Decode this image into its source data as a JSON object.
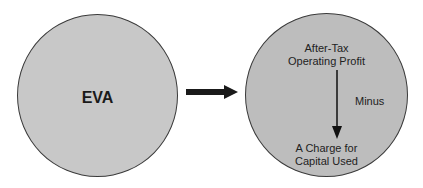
{
  "left_circle": {
    "label": "EVA"
  },
  "right_circle": {
    "top_line1": "After-Tax",
    "top_line2": "Operating Profit",
    "operator": "Minus",
    "bottom_line1": "A Charge for",
    "bottom_line2": "Capital Used"
  },
  "colors": {
    "circle_fill": "#c8c8c8",
    "outline": "#3a3a3a",
    "arrow": "#1a1a1a"
  }
}
